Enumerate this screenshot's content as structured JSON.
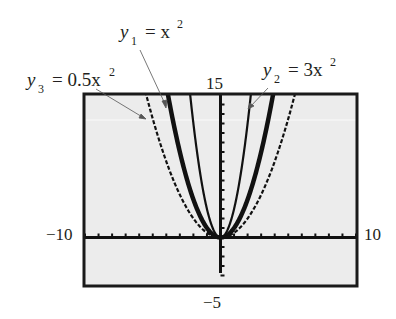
{
  "chart_data": {
    "type": "line",
    "title": "",
    "xlabel": "",
    "ylabel": "",
    "xlim": [
      -10,
      10
    ],
    "ylim": [
      -5,
      15
    ],
    "xscale": 1,
    "yscale": 1,
    "grid": false,
    "background": "#ececec",
    "window_labels": {
      "xmin": "−10",
      "xmax": "10",
      "ymin": "−5",
      "ymax": "15"
    },
    "series": [
      {
        "name": "y1",
        "expression": "x^2",
        "coef": 1,
        "style": "thick",
        "label": {
          "var": "y",
          "sub": "1",
          "rhs": "= x",
          "sup": "2"
        }
      },
      {
        "name": "y2",
        "expression": "3x^2",
        "coef": 3,
        "style": "thin",
        "label": {
          "var": "y",
          "sub": "2",
          "rhs": "= 3x",
          "sup": "2"
        }
      },
      {
        "name": "y3",
        "expression": "0.5x^2",
        "coef": 0.5,
        "style": "dotted",
        "label": {
          "var": "y",
          "sub": "3",
          "rhs": "= 0.5x",
          "sup": "2"
        }
      }
    ]
  }
}
